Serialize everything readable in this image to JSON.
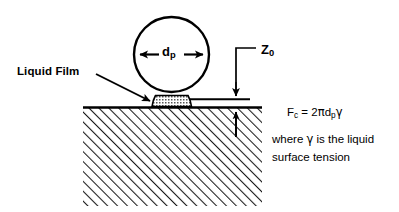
{
  "figure": {
    "labels": {
      "liquid_film": "Liquid Film",
      "particle_diameter": "d",
      "particle_diameter_sub": "p",
      "separation": "Z",
      "separation_sub": "0"
    },
    "equation": {
      "force_symbol": "F",
      "force_sub": "c",
      "relation": " = 2",
      "pi": "π",
      "diameter": "d",
      "diameter_sub": "p",
      "gamma": "γ",
      "full_text": "Fc = 2πdpγ"
    },
    "note": {
      "line1_pre": "where ",
      "line1_gamma": "γ",
      "line1_post": " is the liquid",
      "line2": "surface tension",
      "full_text": "where γ is the liquid surface tension"
    },
    "colors": {
      "ink": "#000000",
      "background": "#ffffff",
      "hatch": "#1a1a1a",
      "meniscus_fill": "#d9d9d9"
    },
    "geometry": {
      "particle": {
        "cx": 171.5,
        "cy": 54.5,
        "r": 37.5
      },
      "substrate": {
        "left": 83,
        "right": 262,
        "top": 107,
        "bottom": 206
      },
      "gap_line": {
        "x1": 190,
        "x2": 250,
        "y": 99
      },
      "meniscus": {
        "left": 152,
        "right": 192,
        "top": 94,
        "bottom": 107
      }
    }
  }
}
